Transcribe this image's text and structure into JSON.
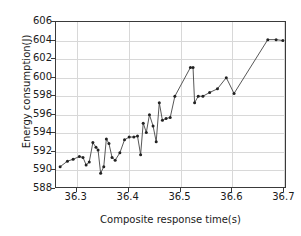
{
  "chart_data": {
    "type": "line",
    "title": "",
    "xlabel": "Composite response time(s)",
    "ylabel": "Energy consumption(J)",
    "xlim": [
      36.26,
      36.705
    ],
    "ylim": [
      588,
      606
    ],
    "xticks": [
      "36.3",
      "36.4",
      "36.5",
      "36.6",
      "36.7"
    ],
    "xtick_values": [
      36.3,
      36.4,
      36.5,
      36.6,
      36.7
    ],
    "yticks": [
      "588",
      "590",
      "592",
      "594",
      "596",
      "598",
      "600",
      "602",
      "604",
      "606"
    ],
    "ytick_values": [
      588,
      590,
      592,
      594,
      596,
      598,
      600,
      602,
      604,
      606
    ],
    "grid": true,
    "legend": null,
    "marker": "dot",
    "line_color": "#444444",
    "marker_color": "#222222",
    "x": [
      36.268,
      36.282,
      36.293,
      36.305,
      36.312,
      36.318,
      36.324,
      36.331,
      36.337,
      36.341,
      36.346,
      36.352,
      36.357,
      36.362,
      36.368,
      36.374,
      36.383,
      36.392,
      36.401,
      36.41,
      36.417,
      36.423,
      36.428,
      36.434,
      36.44,
      36.447,
      36.453,
      36.459,
      36.465,
      36.472,
      36.48,
      36.489,
      36.519,
      36.524,
      36.527,
      36.534,
      36.543,
      36.556,
      36.571,
      36.588,
      36.603,
      36.668,
      36.684,
      36.697
    ],
    "y": [
      590.4,
      591.0,
      591.2,
      591.5,
      591.4,
      590.6,
      590.9,
      593.0,
      592.5,
      592.2,
      589.7,
      590.4,
      593.4,
      592.9,
      591.4,
      591.1,
      591.9,
      593.3,
      593.6,
      593.6,
      593.7,
      591.7,
      595.1,
      594.1,
      596.0,
      594.8,
      593.1,
      597.3,
      595.4,
      595.6,
      595.7,
      598.0,
      601.1,
      601.1,
      597.3,
      598.0,
      598.0,
      598.4,
      598.8,
      600.0,
      598.3,
      604.1,
      604.1,
      604.0
    ],
    "values": [
      590.4,
      591.0,
      591.2,
      591.5,
      591.4,
      590.6,
      590.9,
      593.0,
      592.5,
      592.2,
      589.7,
      590.4,
      593.4,
      592.9,
      591.4,
      591.1,
      591.9,
      593.3,
      593.6,
      593.6,
      593.7,
      591.7,
      595.1,
      594.1,
      596.0,
      594.8,
      593.1,
      597.3,
      595.4,
      595.6,
      595.7,
      598.0,
      601.1,
      601.1,
      597.3,
      598.0,
      598.0,
      598.4,
      598.8,
      600.0,
      598.3,
      604.1,
      604.1,
      604.0
    ]
  }
}
